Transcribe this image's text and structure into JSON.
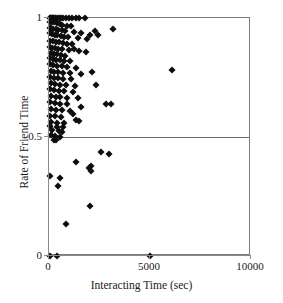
{
  "chart_data": {
    "type": "scatter",
    "title": "",
    "xlabel": "Interacting Time (sec)",
    "ylabel": "Rate of Friend Time",
    "xlim": [
      0,
      10000
    ],
    "ylim": [
      0,
      1
    ],
    "xticks": [
      0,
      5000,
      10000
    ],
    "xtick_labels": [
      "0",
      "5000",
      "10000"
    ],
    "yticks": [
      0,
      0.5,
      1
    ],
    "ytick_labels": [
      "0",
      "0.5",
      "1"
    ],
    "grid": false,
    "legend": null,
    "annotations": [
      {
        "type": "hline",
        "y": 0.5,
        "label": "",
        "color": "#6f6f6f"
      }
    ],
    "marker": {
      "shape": "diamond",
      "color": "#0d0d0d",
      "size": 5
    },
    "points": [
      [
        40,
        1.0
      ],
      [
        60,
        1.0
      ],
      [
        90,
        1.0
      ],
      [
        130,
        1.0
      ],
      [
        170,
        1.0
      ],
      [
        210,
        1.0
      ],
      [
        260,
        1.0
      ],
      [
        300,
        1.0
      ],
      [
        360,
        1.0
      ],
      [
        430,
        1.0
      ],
      [
        520,
        1.0
      ],
      [
        600,
        1.0
      ],
      [
        700,
        1.0
      ],
      [
        840,
        1.0
      ],
      [
        980,
        1.0
      ],
      [
        1150,
        1.0
      ],
      [
        1320,
        1.0
      ],
      [
        1500,
        1.0
      ],
      [
        1760,
        1.0
      ],
      [
        60,
        0.985
      ],
      [
        140,
        0.985
      ],
      [
        240,
        0.982
      ],
      [
        380,
        0.978
      ],
      [
        520,
        0.975
      ],
      [
        660,
        0.972
      ],
      [
        900,
        0.968
      ],
      [
        1080,
        0.965
      ],
      [
        30,
        0.96
      ],
      [
        110,
        0.958
      ],
      [
        200,
        0.955
      ],
      [
        330,
        0.952
      ],
      [
        470,
        0.95
      ],
      [
        640,
        0.948
      ],
      [
        810,
        0.945
      ],
      [
        1240,
        0.94
      ],
      [
        1560,
        0.935
      ],
      [
        2050,
        0.93
      ],
      [
        2420,
        0.928
      ],
      [
        3180,
        0.955
      ],
      [
        50,
        0.935
      ],
      [
        150,
        0.932
      ],
      [
        280,
        0.93
      ],
      [
        420,
        0.928
      ],
      [
        600,
        0.925
      ],
      [
        760,
        0.922
      ],
      [
        960,
        0.92
      ],
      [
        1420,
        0.915
      ],
      [
        1880,
        0.912
      ],
      [
        2260,
        0.945
      ],
      [
        70,
        0.905
      ],
      [
        190,
        0.902
      ],
      [
        340,
        0.9
      ],
      [
        500,
        0.898
      ],
      [
        680,
        0.895
      ],
      [
        880,
        0.892
      ],
      [
        1120,
        0.89
      ],
      [
        45,
        0.878
      ],
      [
        160,
        0.875
      ],
      [
        310,
        0.872
      ],
      [
        470,
        0.87
      ],
      [
        650,
        0.868
      ],
      [
        1010,
        0.865
      ],
      [
        1500,
        0.862
      ],
      [
        90,
        0.852
      ],
      [
        230,
        0.85
      ],
      [
        400,
        0.848
      ],
      [
        580,
        0.845
      ],
      [
        780,
        0.842
      ],
      [
        1240,
        0.868
      ],
      [
        60,
        0.83
      ],
      [
        180,
        0.828
      ],
      [
        360,
        0.825
      ],
      [
        540,
        0.822
      ],
      [
        760,
        0.82
      ],
      [
        1060,
        0.818
      ],
      [
        1840,
        0.858
      ],
      [
        40,
        0.805
      ],
      [
        200,
        0.802
      ],
      [
        390,
        0.8
      ],
      [
        620,
        0.798
      ],
      [
        900,
        0.796
      ],
      [
        1350,
        0.79
      ],
      [
        80,
        0.778
      ],
      [
        260,
        0.775
      ],
      [
        460,
        0.772
      ],
      [
        700,
        0.77
      ],
      [
        1020,
        0.768
      ],
      [
        1580,
        0.765
      ],
      [
        6100,
        0.782
      ],
      [
        55,
        0.752
      ],
      [
        240,
        0.75
      ],
      [
        440,
        0.748
      ],
      [
        680,
        0.745
      ],
      [
        1100,
        0.742
      ],
      [
        2120,
        0.772
      ],
      [
        95,
        0.725
      ],
      [
        300,
        0.722
      ],
      [
        520,
        0.72
      ],
      [
        820,
        0.718
      ],
      [
        1280,
        0.715
      ],
      [
        2320,
        0.718
      ],
      [
        65,
        0.7
      ],
      [
        250,
        0.698
      ],
      [
        480,
        0.695
      ],
      [
        760,
        0.692
      ],
      [
        1180,
        0.69
      ],
      [
        110,
        0.672
      ],
      [
        330,
        0.67
      ],
      [
        560,
        0.668
      ],
      [
        900,
        0.665
      ],
      [
        1420,
        0.662
      ],
      [
        50,
        0.645
      ],
      [
        290,
        0.642
      ],
      [
        540,
        0.64
      ],
      [
        880,
        0.638
      ],
      [
        2820,
        0.638
      ],
      [
        3060,
        0.64
      ],
      [
        85,
        0.618
      ],
      [
        340,
        0.615
      ],
      [
        620,
        0.612
      ],
      [
        1020,
        0.61
      ],
      [
        1560,
        0.625
      ],
      [
        35,
        0.59
      ],
      [
        300,
        0.588
      ],
      [
        600,
        0.585
      ],
      [
        1180,
        0.595
      ],
      [
        120,
        0.562
      ],
      [
        420,
        0.56
      ],
      [
        760,
        0.558
      ],
      [
        1320,
        0.572
      ],
      [
        1480,
        0.568
      ],
      [
        70,
        0.545
      ],
      [
        380,
        0.542
      ],
      [
        700,
        0.54
      ],
      [
        160,
        0.528
      ],
      [
        480,
        0.525
      ],
      [
        640,
        0.522
      ],
      [
        90,
        0.508
      ],
      [
        300,
        0.505
      ],
      [
        520,
        0.502
      ],
      [
        250,
        0.488
      ],
      [
        340,
        0.486
      ],
      [
        2580,
        0.435
      ],
      [
        2980,
        0.428
      ],
      [
        1340,
        0.395
      ],
      [
        2100,
        0.378
      ],
      [
        1980,
        0.368
      ],
      [
        2060,
        0.358
      ],
      [
        40,
        0.335
      ],
      [
        560,
        0.328
      ],
      [
        460,
        0.295
      ],
      [
        2020,
        0.21
      ],
      [
        860,
        0.135
      ],
      [
        30,
        0.0
      ],
      [
        420,
        0.0
      ],
      [
        5000,
        0.0
      ]
    ]
  }
}
